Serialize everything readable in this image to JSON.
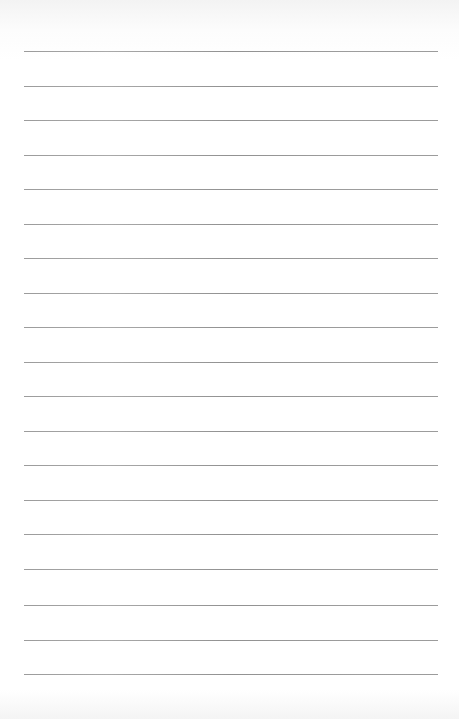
{
  "page": {
    "type": "lined-paper",
    "line_color": "#8a8a8a",
    "background_color": "#ffffff",
    "line_count": 19,
    "lines": [
      {
        "y": 51
      },
      {
        "y": 86
      },
      {
        "y": 120
      },
      {
        "y": 155
      },
      {
        "y": 189
      },
      {
        "y": 224
      },
      {
        "y": 258
      },
      {
        "y": 293
      },
      {
        "y": 327
      },
      {
        "y": 362
      },
      {
        "y": 396
      },
      {
        "y": 431
      },
      {
        "y": 465
      },
      {
        "y": 500
      },
      {
        "y": 534
      },
      {
        "y": 569
      },
      {
        "y": 605
      },
      {
        "y": 640
      },
      {
        "y": 674
      }
    ]
  }
}
